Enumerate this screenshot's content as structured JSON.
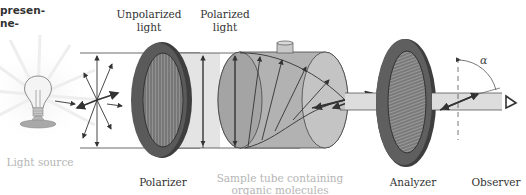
{
  "caption_fragment": {
    "line1": "presen-",
    "line2": "ne-"
  },
  "labels": {
    "unpolarized_light": [
      "Unpolarized",
      "light"
    ],
    "polarized_light": [
      "Polarized",
      "light"
    ],
    "light_source": "Light source",
    "polarizer": "Polarizer",
    "sample_tube": [
      "Sample tube containing",
      "organic molecules"
    ],
    "analyzer": "Analyzer",
    "observer": "Observer",
    "angle_symbol": "α"
  },
  "colors": {
    "disk_rim": "#5a5a5a",
    "disk_face": "#8a8a8a",
    "tube_fill": "#a9a9a9",
    "beam_fill": "#dcdcdc",
    "line": "#333333",
    "faint_text": "#b5b5b5"
  }
}
